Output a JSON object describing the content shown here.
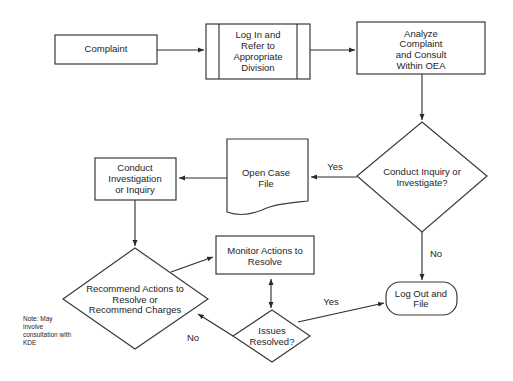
{
  "diagram": {
    "type": "flowchart",
    "nodes": {
      "complaint": {
        "shape": "process",
        "lines": [
          "Complaint"
        ]
      },
      "login": {
        "shape": "predefined-process",
        "lines": [
          "Log In and",
          "Refer to",
          "Appropriate",
          "Division"
        ]
      },
      "analyze": {
        "shape": "process",
        "lines": [
          "Analyze",
          "Complaint",
          "and Consult",
          "Within OEA"
        ]
      },
      "conduct_decision": {
        "shape": "decision",
        "lines": [
          "Conduct Inquiry or",
          "Investigate?"
        ]
      },
      "open_case": {
        "shape": "document",
        "lines": [
          "Open Case",
          "File"
        ]
      },
      "investigate": {
        "shape": "process",
        "lines": [
          "Conduct",
          "Investigation",
          "or Inquiry"
        ]
      },
      "recommend": {
        "shape": "decision",
        "lines": [
          "Recommend Actions to",
          "Resolve or",
          "Recommend Charges"
        ]
      },
      "monitor": {
        "shape": "process",
        "lines": [
          "Monitor Actions to",
          "Resolve"
        ]
      },
      "issues": {
        "shape": "decision",
        "lines": [
          "Issues",
          "Resolved?"
        ]
      },
      "logout": {
        "shape": "terminal",
        "lines": [
          "Log Out and",
          "File"
        ]
      }
    },
    "edges": [
      {
        "from": "complaint",
        "to": "login",
        "label": ""
      },
      {
        "from": "login",
        "to": "analyze",
        "label": ""
      },
      {
        "from": "analyze",
        "to": "conduct_decision",
        "label": ""
      },
      {
        "from": "conduct_decision",
        "to": "open_case",
        "label": "Yes"
      },
      {
        "from": "conduct_decision",
        "to": "logout",
        "label": "No"
      },
      {
        "from": "open_case",
        "to": "investigate",
        "label": ""
      },
      {
        "from": "investigate",
        "to": "recommend",
        "label": ""
      },
      {
        "from": "recommend",
        "to": "monitor",
        "label": ""
      },
      {
        "from": "monitor",
        "to": "issues",
        "label": "",
        "bidirectional": true
      },
      {
        "from": "issues",
        "to": "logout",
        "label": "Yes"
      },
      {
        "from": "issues",
        "to": "recommend",
        "label": "No"
      }
    ],
    "note": [
      "Note: May",
      "involve",
      "consultation with",
      "KDE"
    ]
  }
}
